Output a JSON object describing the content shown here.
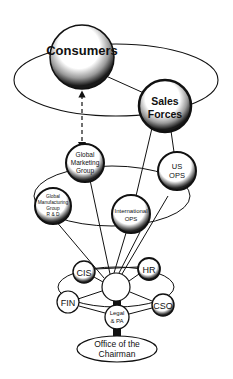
{
  "diagram": {
    "type": "organizational-network",
    "nodes": {
      "consumers": {
        "label": "Consumers"
      },
      "sales_forces": {
        "line1": "Sales",
        "line2": "Forces"
      },
      "global_marketing": {
        "line1": "Global",
        "line2": "Marketing",
        "line3": "Group"
      },
      "us_ops": {
        "line1": "US",
        "line2": "OPS"
      },
      "global_manufacturing": {
        "line1": "Global",
        "line2": "Manufacturing",
        "line3": "Group",
        "line4": "R & D"
      },
      "international_ops": {
        "line1": "International",
        "line2": "OPS"
      },
      "cis": {
        "label": "CIS"
      },
      "hr": {
        "label": "HR"
      },
      "fin": {
        "label": "FIN"
      },
      "cso": {
        "label": "CSO"
      },
      "legal": {
        "line1": "Legal",
        "line2": "& PA"
      },
      "hub": {
        "label": ""
      },
      "chairman": {
        "line1": "Office of the",
        "line2": "Chairman"
      }
    },
    "edges": [
      {
        "from": "consumers",
        "to": "global_marketing",
        "style": "dashed-arrow"
      },
      {
        "from": "consumers",
        "to": "sales_forces",
        "style": "solid"
      },
      {
        "from": "sales_forces",
        "to": "us_ops",
        "style": "solid"
      },
      {
        "from": "sales_forces",
        "to": "international_ops",
        "style": "solid"
      },
      {
        "from": "hub",
        "to": "global_marketing",
        "style": "solid"
      },
      {
        "from": "hub",
        "to": "global_manufacturing",
        "style": "solid"
      },
      {
        "from": "hub",
        "to": "international_ops",
        "style": "solid"
      },
      {
        "from": "hub",
        "to": "us_ops",
        "style": "solid"
      },
      {
        "from": "hub",
        "to": "cis",
        "style": "solid"
      },
      {
        "from": "hub",
        "to": "hr",
        "style": "solid"
      },
      {
        "from": "hub",
        "to": "fin",
        "style": "solid"
      },
      {
        "from": "hub",
        "to": "cso",
        "style": "solid"
      },
      {
        "from": "hub",
        "to": "legal",
        "style": "thick"
      },
      {
        "from": "legal",
        "to": "chairman",
        "style": "thick"
      }
    ],
    "colors": {
      "ink": "#111111",
      "background": "#ffffff"
    }
  }
}
